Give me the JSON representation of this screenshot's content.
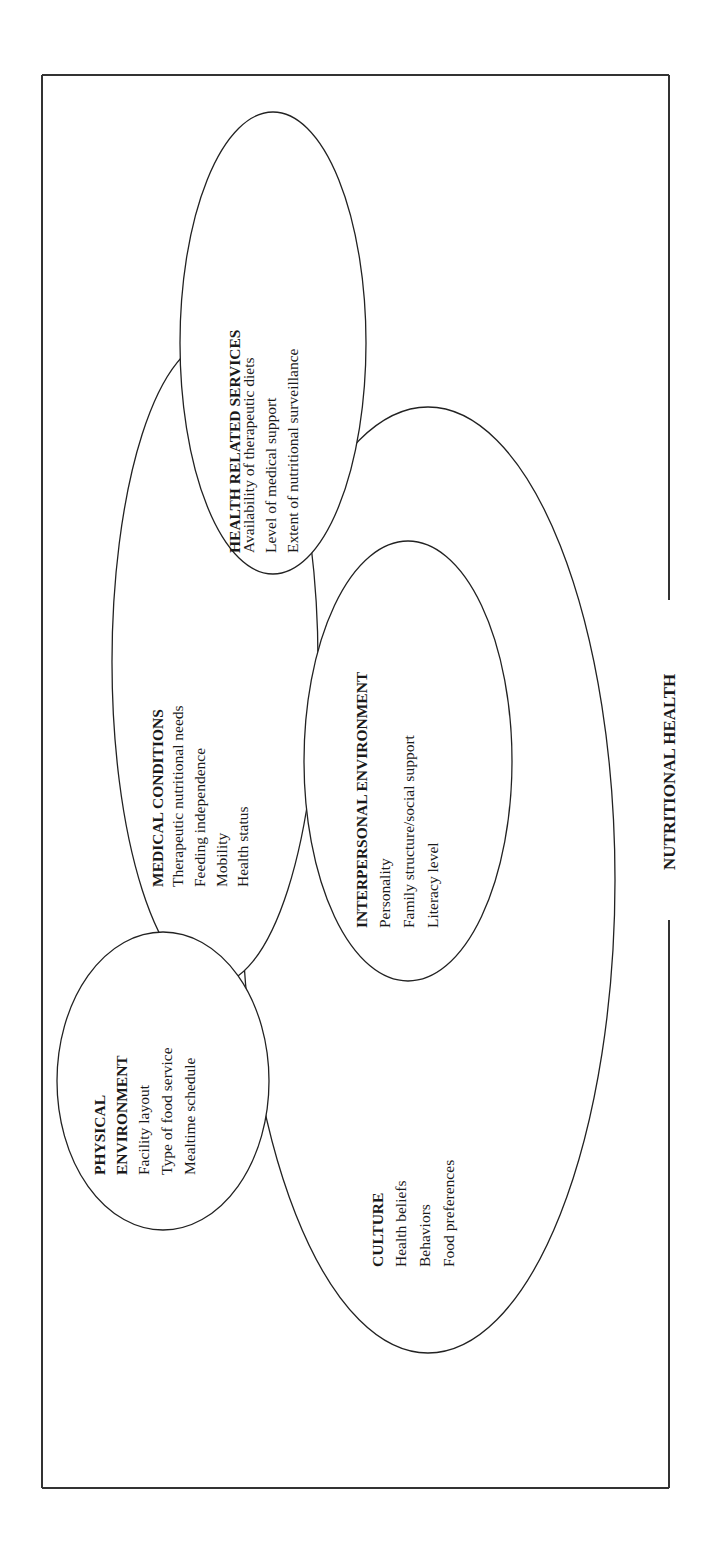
{
  "diagram": {
    "title": "NUTRITIONAL HEALTH",
    "orientation": "rotated 90° (text reads bottom-to-top)",
    "colors": {
      "line": "#222222",
      "background": "#ffffff",
      "text": "#1a1a1a"
    },
    "groups": [
      {
        "id": "health",
        "heading": "HEALTH RELATED SERVICES",
        "items": [
          "Availability of therapeutic diets",
          "Level of medical support",
          "Extent of nutritional surveillance"
        ]
      },
      {
        "id": "medical",
        "heading": "MEDICAL CONDITIONS",
        "items": [
          "Therapeutic nutritional needs",
          "Feeding independence",
          "Mobility",
          "Health status"
        ]
      },
      {
        "id": "physical",
        "heading": [
          "PHYSICAL",
          "ENVIRONMENT"
        ],
        "items": [
          "Facility layout",
          "Type of food service",
          "Mealtime schedule"
        ]
      },
      {
        "id": "interpersonal",
        "heading": "INTERPERSONAL ENVIRONMENT",
        "items": [
          "Personality",
          "Family structure/social support",
          "Literacy level"
        ]
      },
      {
        "id": "culture",
        "heading": "CULTURE",
        "items": [
          "Health beliefs",
          "Behaviors",
          "Food preferences"
        ]
      }
    ]
  }
}
